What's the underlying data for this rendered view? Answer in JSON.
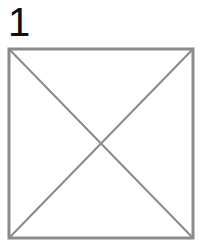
{
  "diagram": {
    "label": "1",
    "shape": "square-with-diagonals",
    "stroke_color": "#888888",
    "square": {
      "x": 8,
      "y": 48,
      "size": 185
    }
  }
}
